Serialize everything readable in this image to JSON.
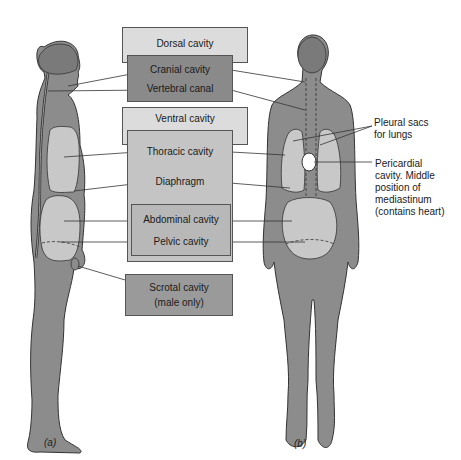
{
  "figure": {
    "colors": {
      "body_fill": "#8c8c8c",
      "cavity_fill": "#c8c8c8",
      "dark_box": "#8a8a8a",
      "light_box": "#dcdcdc",
      "mid_box": "#c4c4c4",
      "outline": "#333333"
    },
    "boxes": {
      "dorsal": "Dorsal cavity",
      "cranial": "Cranial cavity",
      "vertebral": "Vertebral canal",
      "ventral": "Ventral cavity",
      "thoracic": "Thoracic cavity",
      "diaphragm": "Diaphragm",
      "abdominal": "Abdominal cavity",
      "pelvic": "Pelvic cavity",
      "scrotal_line1": "Scrotal cavity",
      "scrotal_line2": "(male only)"
    },
    "side_labels": {
      "pleural_line1": "Pleural sacs",
      "pleural_line2": "for lungs",
      "pericardial_line1": "Pericardial",
      "pericardial_line2": "cavity.  Middle",
      "pericardial_line3": "position of",
      "pericardial_line4": "mediastinum",
      "pericardial_line5": "(contains heart)"
    },
    "captions": {
      "a": "(a)",
      "b": "(b)"
    }
  }
}
